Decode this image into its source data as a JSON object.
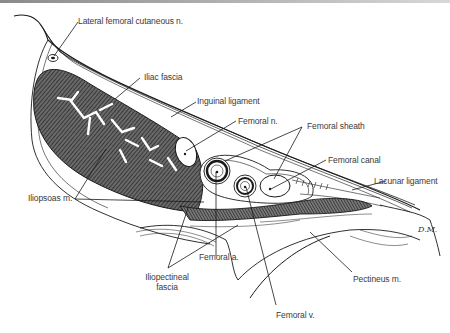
{
  "figure": {
    "signature": "D.M.",
    "colors": {
      "ink": "#1a1a1a",
      "label_text": "#3a3a3a",
      "hatch_fill": "#555555",
      "background": "#ffffff"
    }
  },
  "labels": {
    "lateral_femoral_cutaneous": "Lateral femoral cutaneous n.",
    "iliac_fascia": "Iliac fascia",
    "inguinal_ligament": "Inguinal ligament",
    "femoral_n": "Femoral n.",
    "femoral_sheath": "Femoral sheath",
    "femoral_canal": "Femoral canal",
    "lacunar_ligament": "Lacunar ligament",
    "iliopsoas": "Iliopsoas m.",
    "femoral_a": "Femoral a.",
    "iliopectineal_line1": "Iliopectineal",
    "iliopectineal_line2": "fascia",
    "pectineus": "Pectineus m.",
    "femoral_v": "Femoral v."
  }
}
